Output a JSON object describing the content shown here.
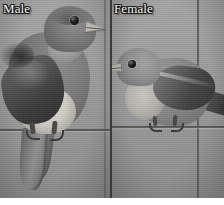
{
  "figure": {
    "type": "two-panel-photograph",
    "media": "grayscale photograph",
    "background_color": "#9b9b9b",
    "divider_color": "#3a3a3a",
    "label_text_color": "#f3f1ec",
    "label_outline_color": "#1c1c1c",
    "panels": [
      {
        "id": "male",
        "label": "Male",
        "subject": "bluebird perched on a wire, facing right, long tail hanging down",
        "icons": {
          "bird": "bird-icon",
          "wire": "wire-icon"
        }
      },
      {
        "id": "female",
        "label": "Female",
        "subject": "bluebird perched on a wire, facing left, tail extending to the right past a vertical pole",
        "icons": {
          "bird": "bird-icon",
          "wire": "wire-icon",
          "pole": "pole-icon"
        }
      }
    ]
  }
}
